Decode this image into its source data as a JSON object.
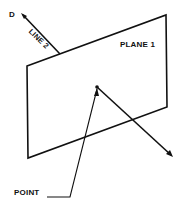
{
  "diagram": {
    "labels": {
      "d": "D",
      "line2": "LINE 2",
      "plane1": "PLANE 1",
      "point": "POINT"
    },
    "colors": {
      "stroke": "#111111",
      "background": "#ffffff"
    }
  }
}
